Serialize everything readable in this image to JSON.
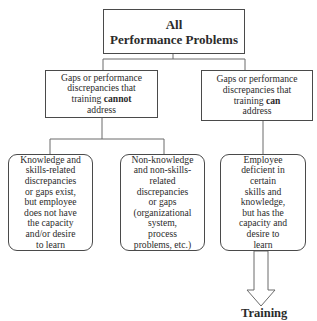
{
  "diagram": {
    "type": "hierarchy",
    "root": {
      "label": "All\nPerformance Problems"
    },
    "branches": [
      {
        "id": "cannot",
        "label_pre": "Gaps or performance\ndiscrepancies that\ntraining ",
        "label_bold": "cannot",
        "label_post": "\naddress",
        "children": [
          {
            "label": "Knowledge and\nskills-related\ndiscrepancies\nor gaps exist,\nbut employee\ndoes not have\nthe capacity\nand/or desire\nto learn"
          },
          {
            "label": "Non-knowledge\nand non-skills-\nrelated\ndiscrepancies\nor gaps\n(organizational\nsystem,\nprocess\nproblems, etc.)"
          }
        ]
      },
      {
        "id": "can",
        "label_pre": "Gaps or performance\ndiscrepancies that\ntraining ",
        "label_bold": "can",
        "label_post": "\naddress",
        "children": [
          {
            "label": "Employee\ndeficient in\ncertain\nskills and\nknowledge,\nbut has the\ncapacity and\ndesire to\nlearn"
          }
        ]
      }
    ],
    "outcome": {
      "label": "Training"
    },
    "colors": {
      "line": "#4a4a4a",
      "text": "#2b2b2b",
      "background": "#ffffff"
    }
  }
}
